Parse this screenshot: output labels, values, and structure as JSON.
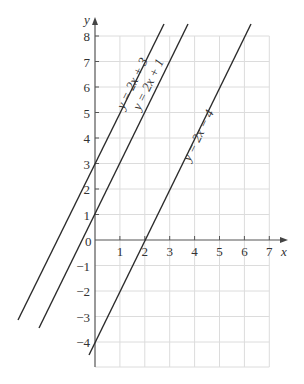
{
  "axes": {
    "x_label": "x",
    "y_label": "y",
    "origin_label": "0",
    "x_ticks": [
      "1",
      "2",
      "3",
      "4",
      "5",
      "6",
      "7"
    ],
    "y_ticks": [
      "8",
      "7",
      "6",
      "5",
      "4",
      "3",
      "2",
      "1",
      "−1",
      "−2",
      "−3",
      "−4"
    ]
  },
  "lines": [
    {
      "label": "y = 2x + 3",
      "slope": 2,
      "intercept": 3
    },
    {
      "label": "y = 2x + 1",
      "slope": 2,
      "intercept": 1
    },
    {
      "label": "y = 2x − 4",
      "slope": 2,
      "intercept": -4
    }
  ],
  "colors": {
    "grid": "#d9d9d9",
    "axis": "#555555",
    "line": "#2b2b2b"
  }
}
